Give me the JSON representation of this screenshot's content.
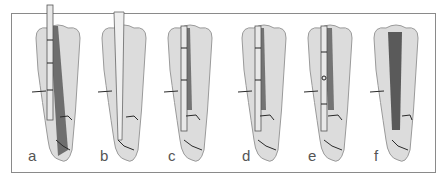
{
  "figure": {
    "panels": [
      {
        "label": "a",
        "content": "file in canal, dark filled canal lower region"
      },
      {
        "label": "b",
        "content": "tapered canal with cone/post, no fill"
      },
      {
        "label": "c",
        "content": "instrument with segmented markings in canal"
      },
      {
        "label": "d",
        "content": "instrument with segmented markings in canal"
      },
      {
        "label": "e",
        "content": "instrument with ring marker in canal"
      },
      {
        "label": "f",
        "content": "canal fully filled (dark obturation)"
      }
    ],
    "colors": {
      "frame": "#8a8a8a",
      "tooth_fill": "#dcdcdc",
      "tooth_outline": "#9a9a9a",
      "canal_dark": "#5a5a5a",
      "instrument": "#e8e8e8",
      "crack_lines": "#2a2a2a",
      "label_text": "#555555"
    }
  }
}
